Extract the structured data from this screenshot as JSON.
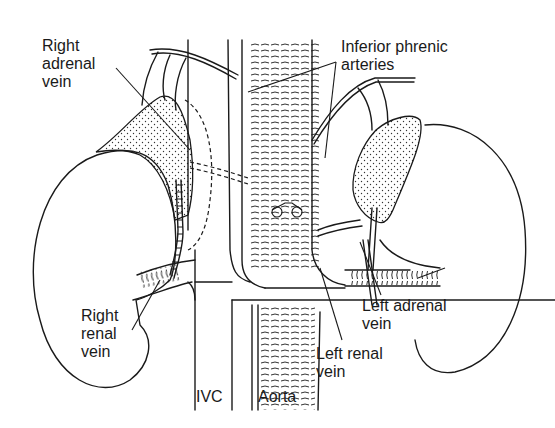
{
  "figure": {
    "type": "anatomical line drawing",
    "labels": {
      "right_adrenal_vein": "Right\nadrenal\nvein",
      "inferior_phrenic_arteries": "Inferior phrenic\narteries",
      "right_renal_vein": "Right\nrenal\nvein",
      "ivc": "IVC",
      "aorta": "Aorta",
      "left_adrenal_vein": "Left adrenal\nvein",
      "left_renal_vein": "Left renal\nvein"
    },
    "colors": {
      "ink": "#1a1a1a",
      "background": "#ffffff"
    }
  }
}
